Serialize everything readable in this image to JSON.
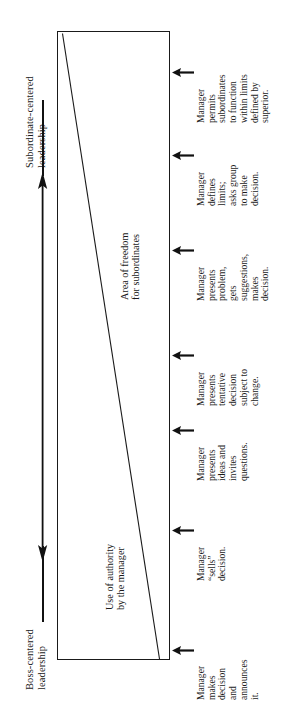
{
  "diagram": {
    "orientation": "rotated-90-ccw",
    "continuum": {
      "top_label_line1": "Subordinate-centered",
      "top_label_line2": "leadership",
      "bottom_label_line1": "Boss-centered",
      "bottom_label_line2": "leadership",
      "arrow_type": "double-headed"
    },
    "regions": [
      {
        "name": "authority",
        "line1": "Use of authority",
        "line2": "by the manager"
      },
      {
        "name": "freedom",
        "line1": "Area of freedom",
        "line2": "for subordinates"
      }
    ],
    "stages": [
      {
        "index": 1,
        "lines": [
          "Manager",
          "makes",
          "decision",
          "and",
          "announces",
          "it."
        ]
      },
      {
        "index": 2,
        "lines": [
          "Manager",
          "“sells”",
          "decision."
        ]
      },
      {
        "index": 3,
        "lines": [
          "Manager",
          "presents",
          "ideas and",
          "invites",
          "questions."
        ]
      },
      {
        "index": 4,
        "lines": [
          "Manager",
          "presents",
          "tentative",
          "decision",
          "subject to",
          "change."
        ]
      },
      {
        "index": 5,
        "lines": [
          "Manager",
          "presents",
          "problem,",
          "gets",
          "suggestions,",
          "makes",
          "decision."
        ]
      },
      {
        "index": 6,
        "lines": [
          "Manager",
          "defines",
          "limits;",
          "asks group",
          "to make",
          "decision."
        ]
      },
      {
        "index": 7,
        "lines": [
          "Manager",
          "permits",
          "subordinates",
          "to function",
          "within limits",
          "defined by",
          "superior."
        ]
      }
    ],
    "colors": {
      "ink": "#1a1a1a",
      "background": "#ffffff"
    }
  }
}
